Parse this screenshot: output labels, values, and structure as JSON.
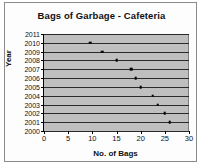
{
  "chart_data": {
    "type": "scatter",
    "title": "Bags of Garbage - Cafeteria",
    "xlabel": "No. of Bags",
    "ylabel": "Year",
    "xlim": [
      0,
      30
    ],
    "xticks": [
      0,
      5,
      10,
      15,
      20,
      25,
      30
    ],
    "ylim": [
      2000,
      2011
    ],
    "yticks": [
      2011,
      2010,
      2009,
      2008,
      2007,
      2006,
      2005,
      2004,
      2003,
      2002,
      2001,
      2000
    ],
    "grid": "horizontal",
    "legend": "none",
    "points": [
      {
        "year": 2010,
        "bags": 9.5
      },
      {
        "year": 2009,
        "bags": 12
      },
      {
        "year": 2008,
        "bags": 15
      },
      {
        "year": 2007,
        "bags": 18
      },
      {
        "year": 2006,
        "bags": 19
      },
      {
        "year": 2005,
        "bags": 20
      },
      {
        "year": 2004,
        "bags": 22.5
      },
      {
        "year": 2003,
        "bags": 23.5
      },
      {
        "year": 2002,
        "bags": 25
      },
      {
        "year": 2001,
        "bags": 26
      }
    ]
  }
}
